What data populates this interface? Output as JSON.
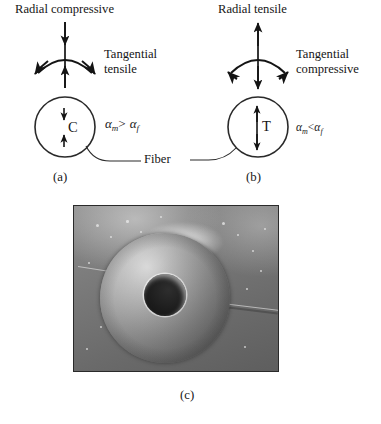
{
  "figure": {
    "type": "scientific-figure"
  },
  "panel_a": {
    "caption": "(a)",
    "radial_label": "Radial compressive",
    "tangential_label_line1": "Tangential",
    "tangential_label_line2": "tensile",
    "core_label": "C",
    "fiber_label": "Fiber",
    "condition": {
      "alpha": "α",
      "sub_matrix": "m",
      "operator": ">",
      "sub_fiber": "f",
      "text": "αm > αf"
    }
  },
  "panel_b": {
    "caption": "(b)",
    "radial_label": "Radial tensile",
    "tangential_label_line1": "Tangential",
    "tangential_label_line2": "compressive",
    "core_label": "T",
    "condition": {
      "alpha": "α",
      "sub_matrix": "m",
      "operator": "<",
      "sub_fiber": "f",
      "text": "αm < αf"
    }
  },
  "panel_c": {
    "caption": "(c)",
    "description": "SEM micrograph: annular fiber cross-section with dark central hole and radial crack in matrix"
  },
  "colors": {
    "ink": "#161616",
    "line": "#1a1a1a",
    "page_background": "#ffffff",
    "micrograph_border": "#2a2a2a",
    "micrograph_background": "#6e6e6e"
  }
}
